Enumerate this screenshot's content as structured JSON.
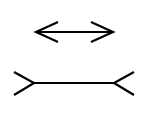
{
  "diagram": {
    "title": "",
    "type": "Muller-Lyer illusion",
    "background": "#ffffff",
    "stroke_color": "#000000",
    "figures": [
      {
        "name": "arrows-inward",
        "shaft": [
          36,
          32,
          114,
          32
        ]
      },
      {
        "name": "fins-outward",
        "shaft": [
          34,
          83,
          114,
          83
        ]
      }
    ]
  }
}
